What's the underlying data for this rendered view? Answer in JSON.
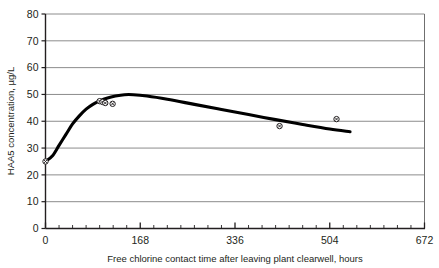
{
  "chart_data": {
    "type": "line",
    "title": "",
    "xlabel": "Free chlorine contact time after leaving plant clearwell, hours",
    "ylabel": "HAA5 concentration, µg/L",
    "xlim": [
      0,
      672
    ],
    "ylim": [
      0,
      80
    ],
    "xticks": [
      0,
      168,
      336,
      504,
      672
    ],
    "yticks": [
      0,
      10,
      20,
      30,
      40,
      50,
      60,
      70,
      80
    ],
    "x_minor_tick_interval": 24,
    "grid": "horizontal",
    "legend": "none",
    "series": [
      {
        "name": "Fitted trend curve",
        "type": "line",
        "style": "thick-black-smooth",
        "points": [
          {
            "x": 0,
            "y": 25
          },
          {
            "x": 12,
            "y": 27
          },
          {
            "x": 24,
            "y": 31
          },
          {
            "x": 36,
            "y": 35
          },
          {
            "x": 48,
            "y": 39
          },
          {
            "x": 60,
            "y": 42
          },
          {
            "x": 72,
            "y": 44.5
          },
          {
            "x": 84,
            "y": 46.3
          },
          {
            "x": 96,
            "y": 47.6
          },
          {
            "x": 110,
            "y": 48.7
          },
          {
            "x": 124,
            "y": 49.4
          },
          {
            "x": 140,
            "y": 49.9
          },
          {
            "x": 156,
            "y": 49.9
          },
          {
            "x": 180,
            "y": 49.4
          },
          {
            "x": 216,
            "y": 48.2
          },
          {
            "x": 264,
            "y": 46.3
          },
          {
            "x": 312,
            "y": 44.4
          },
          {
            "x": 360,
            "y": 42.5
          },
          {
            "x": 408,
            "y": 40.6
          },
          {
            "x": 456,
            "y": 38.8
          },
          {
            "x": 504,
            "y": 37.1
          },
          {
            "x": 540,
            "y": 36.1
          }
        ]
      },
      {
        "name": "Measured HAA5 samples",
        "type": "scatter",
        "marker": "circle-with-cross",
        "points": [
          {
            "x": 0,
            "y": 25
          },
          {
            "x": 96,
            "y": 47.5
          },
          {
            "x": 101,
            "y": 47.2
          },
          {
            "x": 106,
            "y": 46.8
          },
          {
            "x": 119,
            "y": 46.5
          },
          {
            "x": 415,
            "y": 38.2
          },
          {
            "x": 516,
            "y": 40.8
          }
        ]
      }
    ]
  },
  "axes": {
    "y_axis_title": "HAA5 concentration, µg/L",
    "x_axis_title": "Free chlorine contact time after leaving plant clearwell, hours",
    "y_tick_labels": [
      "0",
      "10",
      "20",
      "30",
      "40",
      "50",
      "60",
      "70",
      "80"
    ],
    "x_tick_labels": [
      "0",
      "168",
      "336",
      "504",
      "672"
    ]
  },
  "colors": {
    "background": "#ffffff",
    "axis": "#231f20",
    "gridline": "#8c8c8c",
    "curve": "#000000",
    "marker_fill": "#ffffff",
    "marker_stroke": "#231f20",
    "text": "#231f20"
  }
}
